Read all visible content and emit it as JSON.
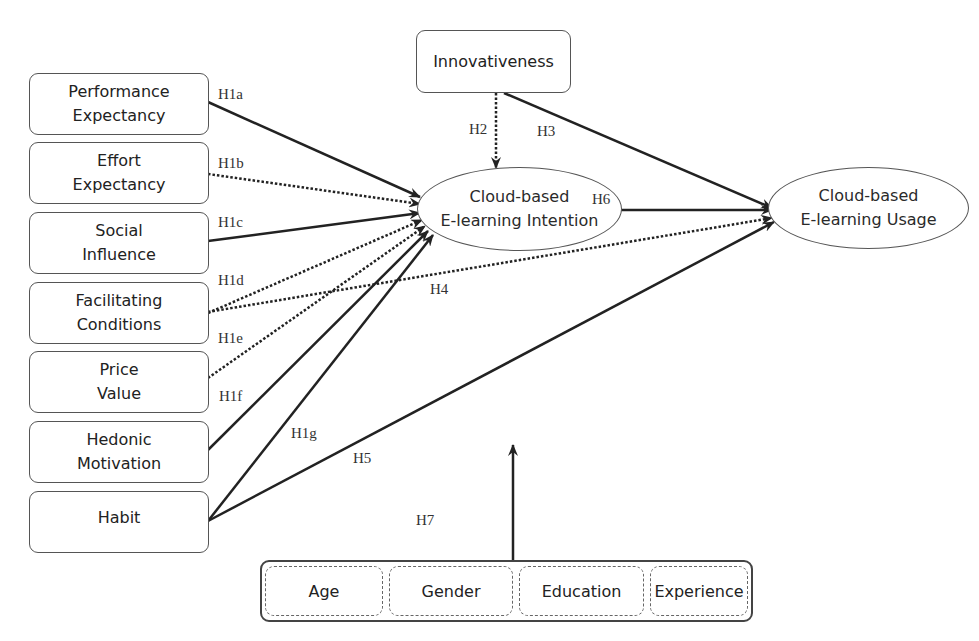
{
  "diagram": {
    "type": "research-model",
    "colors": {
      "line": "#222222",
      "border": "#555555",
      "background": "#ffffff"
    },
    "independent_constructs": [
      {
        "id": "pe",
        "label": "Performance\nExpectancy"
      },
      {
        "id": "ee",
        "label": "Effort\nExpectancy"
      },
      {
        "id": "si",
        "label": "Social\nInfluence"
      },
      {
        "id": "fc",
        "label": "Facilitating\nConditions"
      },
      {
        "id": "pv",
        "label": "Price\nValue"
      },
      {
        "id": "hm",
        "label": "Hedonic\nMotivation"
      },
      {
        "id": "habit",
        "label": "Habit"
      }
    ],
    "innovativeness": {
      "label": "Innovativeness"
    },
    "intention": {
      "label": "Cloud-based\nE-learning Intention"
    },
    "usage": {
      "label": "Cloud-based\nE-learning Usage"
    },
    "moderators": [
      {
        "label": "Age"
      },
      {
        "label": "Gender"
      },
      {
        "label": "Education"
      },
      {
        "label": "Experience"
      }
    ],
    "hypotheses": [
      {
        "label": "H1a",
        "from": "Performance Expectancy",
        "to": "Cloud-based E-learning Intention",
        "style": "solid"
      },
      {
        "label": "H1b",
        "from": "Effort Expectancy",
        "to": "Cloud-based E-learning Intention",
        "style": "dotted"
      },
      {
        "label": "H1c",
        "from": "Social Influence",
        "to": "Cloud-based E-learning Intention",
        "style": "solid"
      },
      {
        "label": "H1d",
        "from": "Facilitating Conditions",
        "to": "Cloud-based E-learning Intention",
        "style": "dotted"
      },
      {
        "label": "H1e",
        "from": "Price Value",
        "to": "Cloud-based E-learning Intention",
        "style": "dotted"
      },
      {
        "label": "H1f",
        "from": "Hedonic Motivation",
        "to": "Cloud-based E-learning Intention",
        "style": "solid"
      },
      {
        "label": "H1g",
        "from": "Habit",
        "to": "Cloud-based E-learning Intention",
        "style": "solid"
      },
      {
        "label": "H2",
        "from": "Innovativeness",
        "to": "Cloud-based E-learning Intention",
        "style": "dotted"
      },
      {
        "label": "H3",
        "from": "Innovativeness",
        "to": "Cloud-based E-learning Usage",
        "style": "solid"
      },
      {
        "label": "H4",
        "from": "Facilitating Conditions",
        "to": "Cloud-based E-learning Usage",
        "style": "dotted"
      },
      {
        "label": "H5",
        "from": "Habit",
        "to": "Cloud-based E-learning Usage",
        "style": "solid"
      },
      {
        "label": "H6",
        "from": "Cloud-based E-learning Intention",
        "to": "Cloud-based E-learning Usage",
        "style": "solid"
      },
      {
        "label": "H7",
        "from": "Moderators (Age, Gender, Education, Experience)",
        "to": "model relationships",
        "style": "solid"
      }
    ]
  }
}
